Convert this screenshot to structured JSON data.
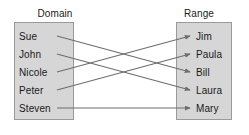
{
  "diagram": {
    "type": "mapping-diagram",
    "domain": {
      "title": "Domain",
      "members": [
        "Sue",
        "John",
        "Nicole",
        "Peter",
        "Steven"
      ]
    },
    "range": {
      "title": "Range",
      "members": [
        "Jim",
        "Paula",
        "Bill",
        "Laura",
        "Mary"
      ]
    },
    "mappings": [
      {
        "from": "Sue",
        "to": "Bill"
      },
      {
        "from": "John",
        "to": "Laura"
      },
      {
        "from": "Nicole",
        "to": "Jim"
      },
      {
        "from": "Peter",
        "to": "Paula"
      },
      {
        "from": "Steven",
        "to": "Mary"
      }
    ],
    "colors": {
      "box_fill": "#d6d6d6",
      "box_border": "#9a9a9a",
      "arrow": "#6d6d6d",
      "text": "#1a1a1a",
      "background": "#ffffff"
    }
  }
}
